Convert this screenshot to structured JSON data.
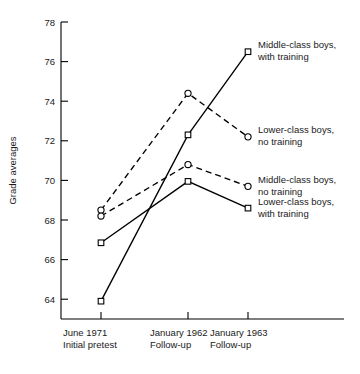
{
  "chart_data": {
    "type": "line",
    "title": "",
    "xlabel": "",
    "ylabel": "Grade averages",
    "ylim": [
      63,
      78
    ],
    "yticks": [
      64,
      66,
      68,
      70,
      72,
      74,
      76,
      78
    ],
    "ytick_labels": [
      "64",
      "66",
      "68",
      "70",
      "72",
      "74",
      "76",
      "78"
    ],
    "grid": false,
    "legend_position": "right-inline",
    "categories": [
      "June 1971\nInitial pretest",
      "January 1962\nFollow-up",
      "January 1963\nFollow-up"
    ],
    "category_lines": [
      [
        "June 1971",
        "Initial pretest"
      ],
      [
        "January 1962",
        "Follow-up"
      ],
      [
        "January 1963",
        "Follow-up"
      ]
    ],
    "series": [
      {
        "name": "Middle-class boys, with training",
        "label_lines": [
          "Middle-class boys,",
          "with training"
        ],
        "values": [
          63.9,
          72.3,
          76.5
        ],
        "style": "solid",
        "marker": "square"
      },
      {
        "name": "Lower-class boys, no training",
        "label_lines": [
          "Lower-class boys,",
          "no training"
        ],
        "values": [
          68.5,
          74.4,
          72.2
        ],
        "style": "dashed",
        "marker": "circle"
      },
      {
        "name": "Middle-class boys, no training",
        "label_lines": [
          "Middle-class boys,",
          "no training"
        ],
        "values": [
          68.2,
          70.8,
          69.7
        ],
        "style": "dashed",
        "marker": "circle"
      },
      {
        "name": "Lower-class boys, with training",
        "label_lines": [
          "Lower-class boys,",
          "with training"
        ],
        "values": [
          66.85,
          69.95,
          68.6
        ],
        "style": "solid",
        "marker": "square"
      }
    ],
    "colors": {
      "line": "#000000",
      "marker_fill": "#ffffff",
      "text": "#1a1a1a",
      "background": "#ffffff"
    }
  }
}
